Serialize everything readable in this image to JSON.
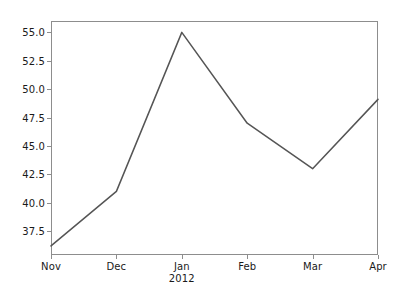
{
  "chart_data": {
    "type": "line",
    "title": "",
    "xlabel": "",
    "ylabel": "",
    "categories": [
      "Nov",
      "Dec",
      "Jan",
      "Feb",
      "Mar",
      "Apr"
    ],
    "category_sublabels": [
      "",
      "",
      "2012",
      "",
      "",
      ""
    ],
    "values": [
      36.2,
      41.0,
      55.0,
      47.0,
      43.0,
      49.1
    ],
    "series": [
      {
        "name": "",
        "values": [
          36.2,
          41.0,
          55.0,
          47.0,
          43.0,
          49.1
        ],
        "color": "#555555"
      }
    ],
    "ylim": [
      35.4,
      56.0
    ],
    "yticks": [
      37.5,
      40.0,
      42.5,
      45.0,
      47.5,
      50.0,
      52.5,
      55.0
    ],
    "ytick_labels": [
      "37.5",
      "40.0",
      "42.5",
      "45.0",
      "47.5",
      "50.0",
      "52.5",
      "55.0"
    ],
    "xticks": [
      0,
      1,
      2,
      3,
      4,
      5
    ],
    "grid": false,
    "legend": false,
    "markers": false,
    "line_color": "#555555",
    "axes_color": "#8d8d8d",
    "background_color": "#ffffff"
  }
}
